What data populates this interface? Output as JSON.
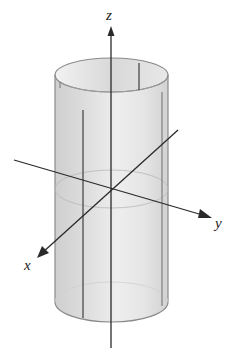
{
  "figure": {
    "axes": {
      "x": {
        "label": "x"
      },
      "y": {
        "label": "y"
      },
      "z": {
        "label": "z"
      }
    },
    "colors": {
      "surface": "#d9d9d9",
      "surface_light": "#efefef",
      "edge": "#8a8a8a",
      "axis": "#2a2a2a"
    }
  }
}
